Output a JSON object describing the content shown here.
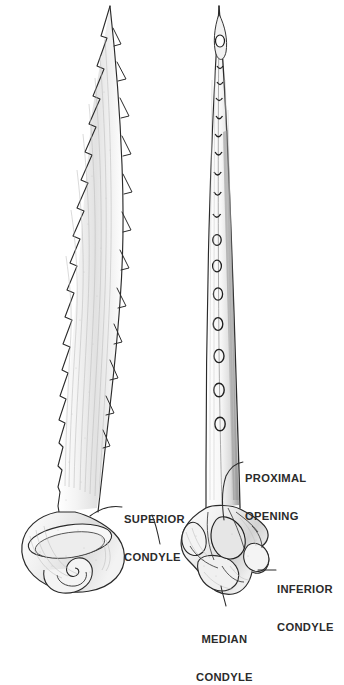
{
  "figure": {
    "background_color": "#ffffff",
    "ink_color": "#1a1a1a",
    "label_color": "#2b2b2b",
    "shade_color": "#bfbfbf"
  },
  "specimens": [
    {
      "id": "left-specimen",
      "name": "lateral-view-spine",
      "description": "Serrated barbed spine in lateral view with flared bulbous base and spiral scroll structure"
    },
    {
      "id": "right-specimen",
      "name": "ventral-view-spine",
      "description": "Slender spine in ventral view showing a median row of pores and a complex condylar base"
    }
  ],
  "annotations": [
    {
      "id": "superior-condyle",
      "name": "label-superior-condyle",
      "lines": [
        "SUPERIOR",
        "CONDYLE"
      ],
      "align": "left"
    },
    {
      "id": "proximal-opening",
      "name": "label-proximal-opening",
      "lines": [
        "PROXIMAL",
        "OPENING"
      ],
      "align": "left"
    },
    {
      "id": "inferior-condyle",
      "name": "label-inferior-condyle",
      "lines": [
        "INFERIOR",
        "CONDYLE"
      ],
      "align": "left"
    },
    {
      "id": "median-condyle",
      "name": "label-median-condyle",
      "lines": [
        "MEDIAN",
        "CONDYLE"
      ],
      "align": "center"
    }
  ]
}
